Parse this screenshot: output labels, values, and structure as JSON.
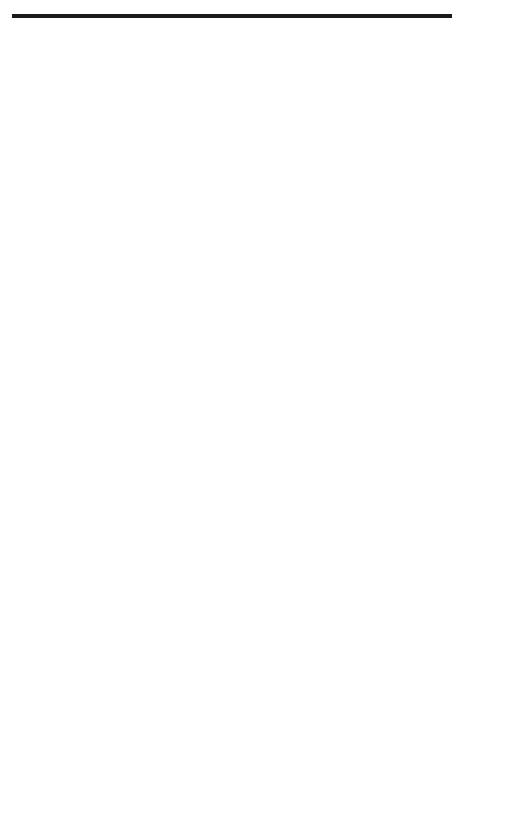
{
  "figure": {
    "number": "FIGURE 3.22"
  },
  "triggering_panel": {
    "y_axis_label": "Triggering",
    "x_axis_label": "Time",
    "rows": [
      {
        "label": "S",
        "sub": "1",
        "pulses": [
          [
            2,
            4
          ],
          [
            8,
            9
          ]
        ]
      },
      {
        "label": "S",
        "sub": "2",
        "pulses": [
          [
            3,
            5
          ]
        ]
      },
      {
        "label": "S",
        "sub": "3",
        "pulses": [
          [
            4,
            6
          ]
        ]
      },
      {
        "label": "S",
        "sub": "4",
        "pulses": [
          [
            0,
            0.5
          ],
          [
            5,
            7
          ]
        ]
      },
      {
        "label": "S",
        "sub": "5",
        "pulses": [
          [
            0,
            1.5
          ],
          [
            6,
            8
          ]
        ]
      },
      {
        "label": "S",
        "sub": "6",
        "pulses": [
          [
            0.5,
            2.5
          ],
          [
            7,
            9
          ]
        ]
      }
    ]
  },
  "phase_panel": {
    "alpha_label": "α",
    "x_axis_label": "Time",
    "curve_labels": [
      {
        "v": "v",
        "sub": "an"
      },
      {
        "v": "v",
        "sub": "bn"
      },
      {
        "v": "v",
        "sub": "cn"
      }
    ]
  },
  "output_panel": {
    "x_axis_label": "Time",
    "segment_labels": [
      {
        "v": "v",
        "sub": "cb"
      },
      {
        "v": "v",
        "sub": "ab"
      },
      {
        "v": "v",
        "sub": "ac"
      },
      {
        "v": "v",
        "sub": "bc"
      },
      {
        "v": "v",
        "sub": "ba"
      },
      {
        "v": "v",
        "sub": "ca"
      },
      {
        "v": "v",
        "sub": "cb"
      }
    ]
  },
  "chart_data": [
    {
      "type": "timing",
      "title": "Triggering",
      "xlabel": "Time",
      "ylabel": "Triggering",
      "interval_unit": "60° (dashed gridlines)",
      "series": [
        {
          "name": "S1",
          "on_intervals": [
            [
              2,
              4
            ],
            [
              8,
              9
            ]
          ]
        },
        {
          "name": "S2",
          "on_intervals": [
            [
              3,
              5
            ]
          ]
        },
        {
          "name": "S3",
          "on_intervals": [
            [
              4,
              6
            ]
          ]
        },
        {
          "name": "S4",
          "on_intervals": [
            [
              0,
              0.5
            ],
            [
              5,
              7
            ]
          ]
        },
        {
          "name": "S5",
          "on_intervals": [
            [
              0,
              1.5
            ],
            [
              6,
              8
            ]
          ]
        },
        {
          "name": "S6",
          "on_intervals": [
            [
              0.5,
              2.5
            ],
            [
              7,
              9
            ]
          ]
        }
      ]
    },
    {
      "type": "line",
      "title": "Three-phase source voltages",
      "xlabel": "Time",
      "series": [
        {
          "name": "v_an",
          "function": "sin(θ)"
        },
        {
          "name": "v_bn",
          "function": "sin(θ-120°)"
        },
        {
          "name": "v_cn",
          "function": "sin(θ+120°)"
        }
      ],
      "annotation": "α (firing delay)",
      "x_range_deg": [
        0,
        555
      ]
    },
    {
      "type": "line",
      "title": "Output voltage",
      "xlabel": "Time",
      "segments": [
        "v_cb",
        "v_ab",
        "v_ac",
        "v_bc",
        "v_ba",
        "v_ca",
        "v_cb"
      ],
      "description": "Each segment jumps to peak at firing instant then decays to zero at next dashed line"
    }
  ]
}
